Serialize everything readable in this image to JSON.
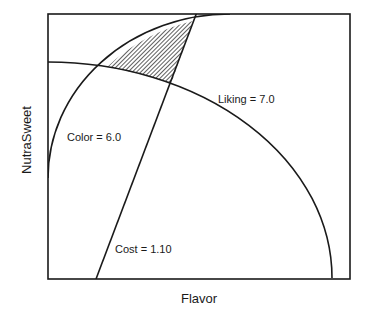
{
  "diagram": {
    "type": "contour-overlay",
    "xlabel": "Flavor",
    "ylabel": "NutraSweet",
    "contours": [
      {
        "name": "Liking",
        "label": "Liking = 7.0",
        "value": 7.0
      },
      {
        "name": "Color",
        "label": "Color = 6.0",
        "value": 6.0
      },
      {
        "name": "Cost",
        "label": "Cost = 1.10",
        "value": 1.1
      }
    ],
    "feasible_region": "hatched",
    "colors": {
      "line": "#1a1a1a",
      "background": "#ffffff"
    }
  }
}
